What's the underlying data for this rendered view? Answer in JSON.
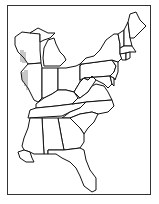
{
  "map": {
    "title": "",
    "region": "Eastern United States outline",
    "style": "black outline, no labels",
    "colors": {
      "background": "#ffffff",
      "stroke": "#111111",
      "frame": "#333333"
    },
    "states": [
      "Wisconsin",
      "Michigan",
      "Illinois",
      "Indiana",
      "Ohio",
      "Kentucky",
      "Tennessee",
      "Mississippi",
      "Alabama",
      "Georgia",
      "Florida",
      "South Carolina",
      "North Carolina",
      "Virginia",
      "West Virginia",
      "Maryland",
      "Delaware",
      "Pennsylvania",
      "New Jersey",
      "New York",
      "Connecticut",
      "Rhode Island",
      "Massachusetts",
      "Vermont",
      "New Hampshire",
      "Maine"
    ]
  }
}
